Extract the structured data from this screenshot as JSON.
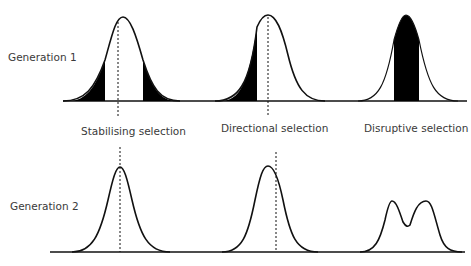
{
  "rows": [
    {
      "label": "Generation 1"
    },
    {
      "label": "Generation 2"
    }
  ],
  "selection_types": [
    {
      "label": "Stabilising selection"
    },
    {
      "label": "Directional selection"
    },
    {
      "label": "Disruptive selection"
    }
  ],
  "colors": {
    "line": "#111111",
    "fill": "#000000",
    "text": "#3a3a3a"
  }
}
